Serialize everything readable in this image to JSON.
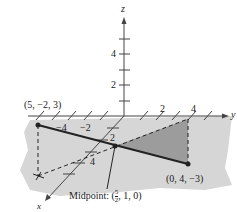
{
  "diagram": {
    "axes": {
      "z": {
        "label": "z",
        "ticks": [
          "2",
          "4"
        ]
      },
      "y": {
        "label": "y",
        "ticks": [
          "2",
          "4"
        ]
      },
      "x": {
        "label": "x",
        "ticks": [
          "2",
          "4"
        ]
      },
      "neg_y_ticks": [
        "−4",
        "−2"
      ]
    },
    "points": {
      "p1": {
        "label": "(5, −2, 3)"
      },
      "p2": {
        "label": "(0, 4, −3)"
      },
      "midpoint": {
        "prefix": "Midpoint: (",
        "frac_num": "5",
        "frac_den": "2",
        "suffix": ", 1, 0)"
      }
    },
    "colors": {
      "plane": "#d4d4d4",
      "triangle": "#9a9a9a",
      "line": "#222222"
    }
  }
}
